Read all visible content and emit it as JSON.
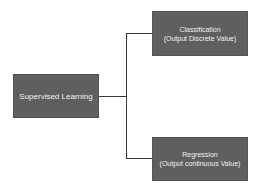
{
  "diagram": {
    "type": "tree",
    "root": {
      "label": "Supervised Learning"
    },
    "children": [
      {
        "title": "Classification",
        "subtitle": "(Output Discrete Value)"
      },
      {
        "title": "Regression",
        "subtitle": "(Output continuous Value)"
      }
    ],
    "colors": {
      "node_fill": "#5f5f5f",
      "node_text": "#f0f0f0",
      "connector": "#3a3a3a",
      "background": "#ffffff"
    }
  }
}
